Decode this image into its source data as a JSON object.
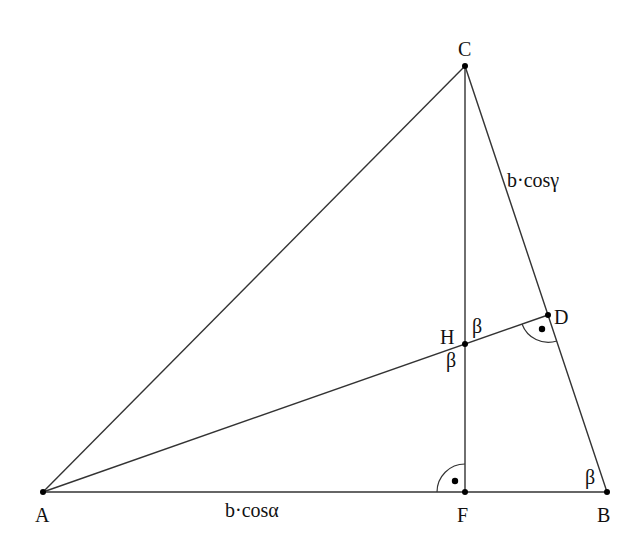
{
  "diagram": {
    "type": "geometry-triangle",
    "points": {
      "A": {
        "label": "A",
        "x": 43,
        "y": 492
      },
      "B": {
        "label": "B",
        "x": 607,
        "y": 492
      },
      "C": {
        "label": "C",
        "x": 465,
        "y": 66
      },
      "D": {
        "label": "D",
        "x": 548,
        "y": 315
      },
      "F": {
        "label": "F",
        "x": 465,
        "y": 492
      },
      "H": {
        "label": "H",
        "x": 465,
        "y": 344
      }
    },
    "segments": [
      "AB",
      "AC",
      "BC",
      "CF",
      "AD"
    ],
    "right_angles": [
      "F",
      "D"
    ],
    "angle_labels": {
      "beta_H_upper": "β",
      "beta_H_lower": "β",
      "beta_B": "β"
    },
    "length_labels": {
      "AF": "b·cosα",
      "CD": "b·cosγ"
    },
    "colors": {
      "line": "#333333",
      "point": "#000000",
      "text": "#111111",
      "background": "#ffffff"
    }
  }
}
